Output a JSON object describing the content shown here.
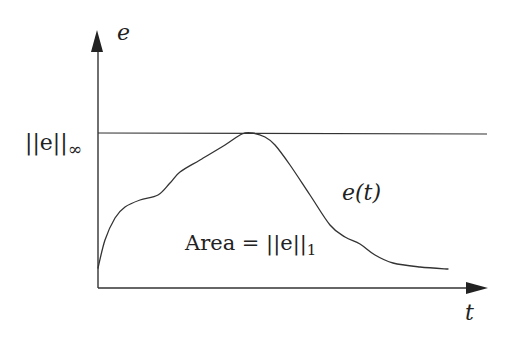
{
  "diagram": {
    "type": "signal-norm-illustration",
    "y_axis_label": "e",
    "x_axis_label": "t",
    "sup_norm_label": "||e||",
    "sup_norm_subscript": "∞",
    "curve_label": "e(t)",
    "area_label_prefix": "Area = ||e||",
    "area_label_subscript": "1",
    "colors": {
      "stroke": "#333333",
      "text": "#222222",
      "background": "#ffffff"
    },
    "curve_points": [
      [
        98,
        268
      ],
      [
        105,
        240
      ],
      [
        115,
        218
      ],
      [
        125,
        207
      ],
      [
        140,
        200
      ],
      [
        158,
        195
      ],
      [
        170,
        183
      ],
      [
        180,
        172
      ],
      [
        200,
        160
      ],
      [
        225,
        145
      ],
      [
        242,
        134
      ],
      [
        252,
        133
      ],
      [
        265,
        137
      ],
      [
        275,
        145
      ],
      [
        290,
        165
      ],
      [
        310,
        195
      ],
      [
        330,
        225
      ],
      [
        345,
        237
      ],
      [
        360,
        244
      ],
      [
        375,
        255
      ],
      [
        393,
        263
      ],
      [
        420,
        267
      ],
      [
        448,
        269
      ]
    ]
  }
}
